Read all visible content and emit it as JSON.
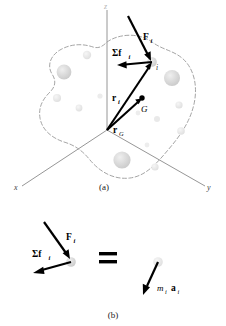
{
  "figure": {
    "colors": {
      "axis": "#8a8a8a",
      "outline": "#9a9a9a",
      "vector": "#000000",
      "particle_fill": "#d6d6d6",
      "particle_fill_light": "#e6e6e6",
      "background": "#ffffff"
    }
  },
  "panel_a": {
    "caption": "(a)",
    "axes": [
      {
        "name": "z-axis",
        "label": "z"
      },
      {
        "name": "x-axis",
        "label": "x"
      },
      {
        "name": "y-axis",
        "label": "y"
      }
    ],
    "labels": {
      "external_force": "F",
      "external_force_sub": "i",
      "internal_force_sum": "Σf",
      "internal_force_sum_sub": "i",
      "position_vector_i": "r",
      "position_vector_i_sub": "i",
      "position_vector_G": "r",
      "position_vector_G_sub": "G",
      "center_of_mass": "G",
      "particle_label": "i"
    },
    "particles": [
      {
        "cx": 64,
        "cy": 72,
        "r": 7.4,
        "fill": "#dcdcdc"
      },
      {
        "cx": 87,
        "cy": 55,
        "r": 4.2,
        "fill": "#e0e0e0"
      },
      {
        "cx": 57,
        "cy": 98,
        "r": 4.0,
        "fill": "#e3e3e3"
      },
      {
        "cx": 79,
        "cy": 108,
        "r": 3.4,
        "fill": "#e6e6e6"
      },
      {
        "cx": 100,
        "cy": 96,
        "r": 2.6,
        "fill": "#eaeaea"
      },
      {
        "cx": 172,
        "cy": 78,
        "r": 8.0,
        "fill": "#dadada"
      },
      {
        "cx": 179,
        "cy": 105,
        "r": 3.6,
        "fill": "#e2e2e2"
      },
      {
        "cx": 157,
        "cy": 119,
        "r": 3.0,
        "fill": "#e8e8e8"
      },
      {
        "cx": 138,
        "cy": 113,
        "r": 2.4,
        "fill": "#ebebeb"
      },
      {
        "cx": 181,
        "cy": 131,
        "r": 3.8,
        "fill": "#e2e2e2"
      },
      {
        "cx": 122,
        "cy": 160,
        "r": 8.6,
        "fill": "#d8d8d8"
      },
      {
        "cx": 155,
        "cy": 167,
        "r": 3.6,
        "fill": "#e2e2e2"
      },
      {
        "cx": 147,
        "cy": 145,
        "r": 2.4,
        "fill": "#ececec"
      },
      {
        "cx": 152,
        "cy": 62,
        "r": 4.6,
        "fill": "#cfcfcf"
      }
    ]
  },
  "panel_b": {
    "caption": "(b)",
    "equals_sign": "=",
    "labels": {
      "external_force": "F",
      "external_force_sub": "i",
      "internal_force_sum": "Σf",
      "internal_force_sum_sub": "i",
      "mass_times_accel_m": "m",
      "mass_times_accel_m_sub": "i",
      "mass_times_accel_a": "a",
      "mass_times_accel_a_sub": "i"
    },
    "particles": [
      {
        "name": "left-particle",
        "cx": 71,
        "cy": 262,
        "r": 4.6,
        "fill": "#cfcfcf"
      },
      {
        "name": "right-particle",
        "cx": 158,
        "cy": 262,
        "r": 4.6,
        "fill": "#dcdcdc"
      }
    ]
  }
}
